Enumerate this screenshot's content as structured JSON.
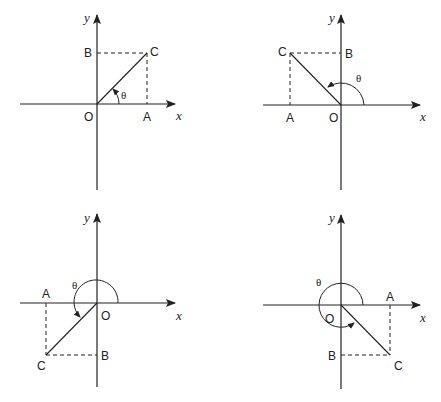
{
  "diagram": {
    "axis_labels": {
      "x": "x",
      "y": "y"
    },
    "theta_symbol": "θ",
    "panels": [
      {
        "name": "quadrant-1",
        "labels": {
          "O": "O",
          "A": "A",
          "B": "B",
          "C": "C"
        }
      },
      {
        "name": "quadrant-2",
        "labels": {
          "O": "O",
          "A": "A",
          "B": "B",
          "C": "C"
        }
      },
      {
        "name": "quadrant-3",
        "labels": {
          "O": "O",
          "A": "A",
          "B": "B",
          "C": "C"
        }
      },
      {
        "name": "quadrant-4",
        "labels": {
          "O": "O",
          "A": "A",
          "B": "B",
          "C": "C"
        }
      }
    ]
  }
}
